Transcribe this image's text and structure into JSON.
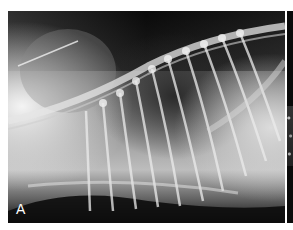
{
  "figure": {
    "panels": [
      {
        "label": "A",
        "description": "Lateral thoracic radiograph"
      },
      {
        "label": "",
        "description": "Adjacent cropped radiograph panel"
      }
    ]
  },
  "colors": {
    "background": "#ffffff",
    "film_dark": "#111111",
    "bone": "#e8e8e8",
    "label_text": "#ffffff"
  }
}
